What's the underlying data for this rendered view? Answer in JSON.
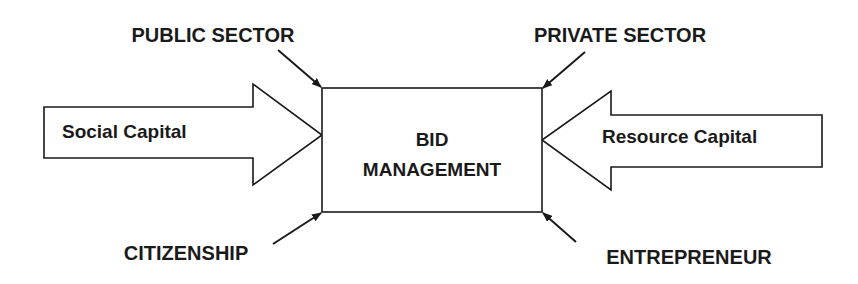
{
  "diagram": {
    "center_box": {
      "line1": "BID",
      "line2": "MANAGEMENT"
    },
    "inputs": {
      "left_arrow_label": "Social Capital",
      "right_arrow_label": "Resource Capital"
    },
    "corner_labels": {
      "top_left": "PUBLIC SECTOR",
      "top_right": "PRIVATE SECTOR",
      "bottom_left": "CITIZENSHIP",
      "bottom_right": "ENTREPRENEUR"
    },
    "colors": {
      "stroke": "#1a1a1a",
      "fill": "#ffffff",
      "text": "#1a1a1a"
    }
  }
}
